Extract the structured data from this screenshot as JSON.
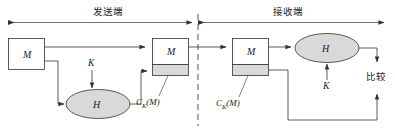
{
  "diagram": {
    "sections": [
      {
        "id": "sender",
        "label": "发送端"
      },
      {
        "id": "receiver",
        "label": "接收端"
      }
    ],
    "nodes": [
      {
        "id": "msg-source",
        "label": "M",
        "shape": "rect"
      },
      {
        "id": "sender-packet",
        "label": "M",
        "shape": "rect-with-tag"
      },
      {
        "id": "receiver-packet",
        "label": "M",
        "shape": "rect-with-tag"
      },
      {
        "id": "hash-sender",
        "label": "H",
        "shape": "ellipse"
      },
      {
        "id": "hash-receiver",
        "label": "H",
        "shape": "ellipse"
      }
    ],
    "keys": [
      {
        "id": "key-sender",
        "label": "K"
      },
      {
        "id": "key-receiver",
        "label": "K"
      }
    ],
    "mac_labels": [
      {
        "id": "mac-sender",
        "base": "C",
        "sub": "K",
        "arg": "(M)"
      },
      {
        "id": "mac-receiver",
        "base": "C",
        "sub": "K",
        "arg": "(M)"
      }
    ],
    "compare": {
      "id": "compare",
      "label": "比较"
    },
    "colors": {
      "stroke": "#333333",
      "ellipse_fill": "#d9d9d9",
      "tag_fill": "#d9d9d9",
      "box_fill": "#ffffff",
      "divider": "#555555",
      "background": "#ffffff"
    }
  }
}
